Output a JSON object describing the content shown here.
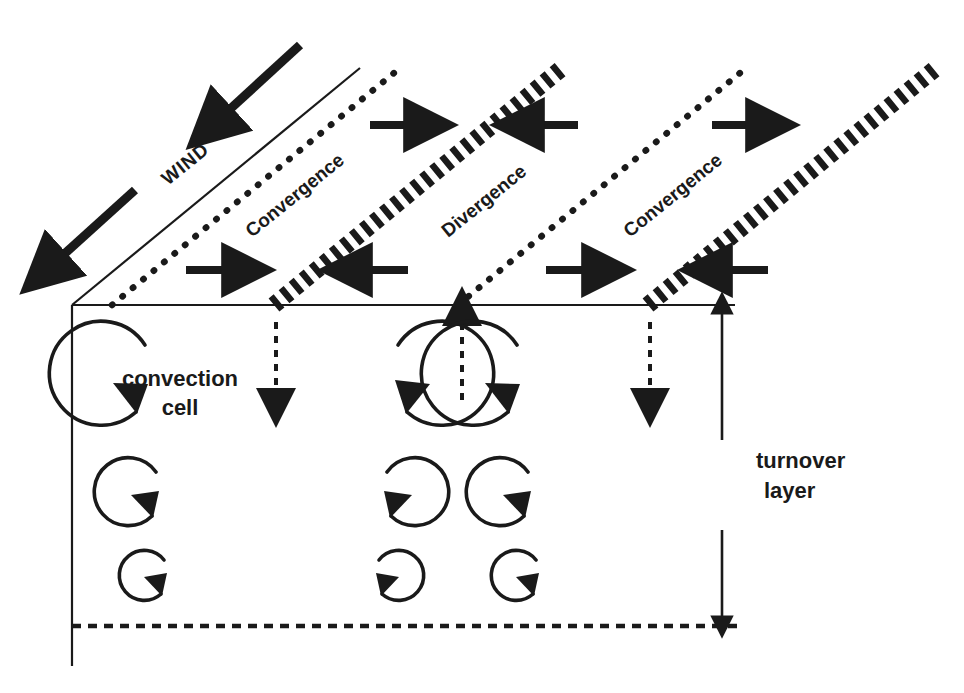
{
  "figure": {
    "background_color": "#ffffff",
    "ink_color": "#1a1a1a",
    "width": 964,
    "height": 693
  },
  "labels": {
    "wind": "WIND",
    "convergence_left": "Convergence",
    "divergence": "Divergence",
    "convergence_right": "Convergence",
    "convection_cell_line1": "convection",
    "convection_cell_line2": "cell",
    "turnover_line1": "turnover",
    "turnover_line2": "layer"
  },
  "icons": {
    "wind_arrow": "arrow-southwest-icon",
    "horizontal_arrow_right": "arrow-right-icon",
    "horizontal_arrow_left": "arrow-left-icon",
    "updraft_arrow": "arrow-up-dashed-icon",
    "downdraft_arrow": "arrow-down-dashed-icon",
    "turnover_arrow_up": "arrow-up-icon",
    "turnover_arrow_down": "arrow-down-icon",
    "circulation_ccw": "circular-arrow-counterclockwise-icon",
    "circulation_cw": "circular-arrow-clockwise-icon"
  },
  "geometry": {
    "baseline_y": 305,
    "box_left_x": 72,
    "box_right_x": 735,
    "box_bottom_y": 626,
    "left_post_bottom_y": 666,
    "diagonal_rise": 237,
    "diagonal_run": 288
  },
  "top_plane": {
    "solid_edge": {
      "from_x": 72,
      "from_y": 305,
      "to_x": 360,
      "to_y": 68
    },
    "bands": [
      {
        "name": "dotted-line-1",
        "style": "dotted",
        "base_x": 112,
        "top_x": 400
      },
      {
        "name": "hatched-convergence-1",
        "style": "hatched",
        "base_x": 274,
        "top_x": 562
      },
      {
        "name": "dotted-line-2",
        "style": "dotted",
        "base_x": 458,
        "top_x": 746
      },
      {
        "name": "hatched-convergence-2",
        "style": "hatched",
        "base_x": 648,
        "top_x": 936
      }
    ]
  },
  "wind_arrows": [
    {
      "name": "wind-arrow-upper",
      "from_x": 300,
      "from_y": 45,
      "to_x": 216,
      "to_y": 122
    },
    {
      "name": "wind-arrow-lower",
      "from_x": 135,
      "from_y": 190,
      "to_x": 48,
      "to_y": 268
    }
  ],
  "surface_arrows": [
    {
      "name": "surface-arrow-1-upper",
      "direction": "right",
      "x": 372,
      "y": 125
    },
    {
      "name": "surface-arrow-2-upper",
      "direction": "left",
      "x": 540,
      "y": 125
    },
    {
      "name": "surface-arrow-3-upper",
      "direction": "right",
      "x": 716,
      "y": 125
    },
    {
      "name": "surface-arrow-1-lower",
      "direction": "right",
      "x": 186,
      "y": 270
    },
    {
      "name": "surface-arrow-2-lower",
      "direction": "left",
      "x": 370,
      "y": 270
    },
    {
      "name": "surface-arrow-3-lower",
      "direction": "right",
      "x": 546,
      "y": 270
    },
    {
      "name": "surface-arrow-4-lower",
      "direction": "left",
      "x": 720,
      "y": 270
    }
  ],
  "vertical_flow_arrows": [
    {
      "name": "downdraft-left",
      "x": 276,
      "direction": "down",
      "from_y": 322,
      "to_y": 404,
      "style": "dashed"
    },
    {
      "name": "updraft-center",
      "x": 462,
      "direction": "up",
      "from_y": 400,
      "to_y": 315,
      "style": "dashed"
    },
    {
      "name": "downdraft-right",
      "x": 650,
      "direction": "down",
      "from_y": 322,
      "to_y": 404,
      "style": "dashed"
    }
  ],
  "convection_columns": [
    {
      "name": "column-left",
      "rotation": "counterclockwise",
      "center_x": 180,
      "circles": [
        {
          "cy": 385,
          "r": 52
        },
        {
          "cy": 495,
          "r": 34
        },
        {
          "cy": 578,
          "r": 25
        }
      ]
    },
    {
      "name": "column-center",
      "rotation": "clockwise",
      "center_x": 363,
      "circles": [
        {
          "cy": 385,
          "r": 52
        },
        {
          "cy": 495,
          "r": 34
        },
        {
          "cy": 578,
          "r": 25
        }
      ]
    },
    {
      "name": "column-right",
      "rotation": "counterclockwise",
      "center_x": 552,
      "circles": [
        {
          "cy": 385,
          "r": 52
        },
        {
          "cy": 495,
          "r": 34
        },
        {
          "cy": 578,
          "r": 25
        }
      ]
    }
  ],
  "turnover_marker": {
    "x": 722,
    "arrow_up_top_y": 308,
    "arrow_up_bottom_y": 440,
    "arrow_down_top_y": 530,
    "arrow_down_bottom_y": 624,
    "label_x": 756,
    "label_line1_y": 468,
    "label_line2_y": 498
  }
}
